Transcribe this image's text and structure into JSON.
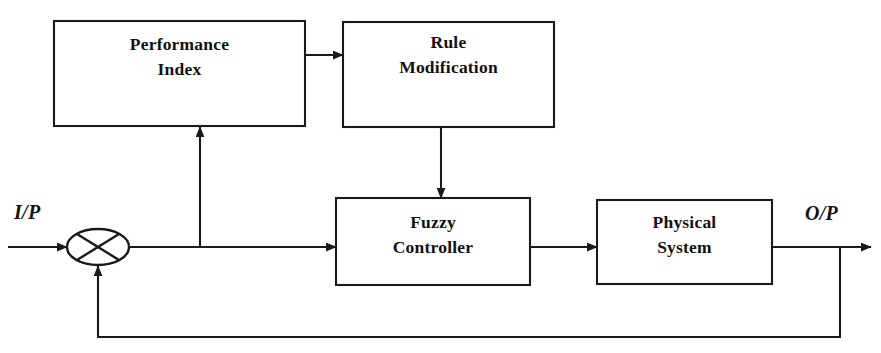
{
  "diagram": {
    "type": "block-diagram",
    "canvas": {
      "width": 881,
      "height": 353,
      "background": "#ffffff"
    },
    "line_color": "#1a1a1a",
    "text_color": "#111111",
    "blocks": [
      {
        "id": "performance-index",
        "label_line1": "Performance",
        "label_line2": "Index",
        "x": 54,
        "y": 21,
        "width": 251,
        "height": 105
      },
      {
        "id": "rule-modification",
        "label_line1": "Rule",
        "label_line2": "Modification",
        "x": 343,
        "y": 22,
        "width": 211,
        "height": 105
      },
      {
        "id": "fuzzy-controller",
        "label_line1": "Fuzzy",
        "label_line2": "Controller",
        "x": 336,
        "y": 198,
        "width": 194,
        "height": 87
      },
      {
        "id": "physical-system",
        "label_line1": "Physical",
        "label_line2": "System",
        "x": 597,
        "y": 200,
        "width": 175,
        "height": 84
      }
    ],
    "junction": {
      "id": "summing-junction",
      "cx": 98,
      "cy": 247,
      "rx": 31,
      "ry": 18,
      "symbol": "cross"
    },
    "io_labels": [
      {
        "id": "input-label",
        "text": "I/P",
        "x": 14,
        "y": 219
      },
      {
        "id": "output-label",
        "text": "O/P",
        "x": 805,
        "y": 220
      }
    ],
    "connections": [
      {
        "id": "input-to-junction",
        "from": "I/P source",
        "to": "summing-junction",
        "arrow": true
      },
      {
        "id": "junction-to-fuzzy-controller",
        "from": "summing-junction",
        "to": "fuzzy-controller",
        "arrow": true
      },
      {
        "id": "error-to-performance-index",
        "from": "error-signal-tap",
        "to": "performance-index",
        "arrow": true
      },
      {
        "id": "performance-index-to-rule-modification",
        "from": "performance-index",
        "to": "rule-modification",
        "arrow": true
      },
      {
        "id": "rule-modification-to-fuzzy-controller",
        "from": "rule-modification",
        "to": "fuzzy-controller",
        "arrow": true
      },
      {
        "id": "fuzzy-controller-to-physical-system",
        "from": "fuzzy-controller",
        "to": "physical-system",
        "arrow": true
      },
      {
        "id": "physical-system-to-output",
        "from": "physical-system",
        "to": "O/P sink",
        "arrow": true
      },
      {
        "id": "feedback-path",
        "from": "output-tap",
        "to": "summing-junction",
        "arrow": true
      }
    ]
  }
}
